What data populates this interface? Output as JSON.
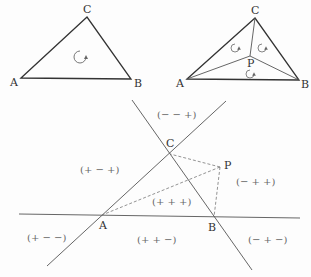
{
  "figure1": {
    "vertices": {
      "A": "A",
      "B": "B",
      "C": "C"
    },
    "orientation_icon": "counterclockwise-arrow"
  },
  "figure2": {
    "vertices": {
      "A": "A",
      "B": "B",
      "C": "C",
      "P": "P"
    },
    "orientation_icons": [
      "counterclockwise-arrow",
      "counterclockwise-arrow",
      "counterclockwise-arrow"
    ]
  },
  "figure3": {
    "vertices": {
      "A": "A",
      "B": "B",
      "C": "C",
      "P": "P"
    },
    "regions": {
      "top": "(− − +)",
      "left": "(+ − +)",
      "right": "(− + +)",
      "center": "(+ + +)",
      "bottom_left": "(+ − −)",
      "bottom_middle": "(+ + −)",
      "bottom_right": "(− + −)"
    }
  }
}
